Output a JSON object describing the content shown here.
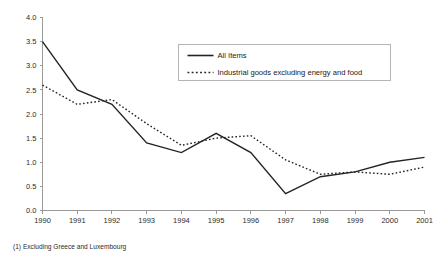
{
  "footnote": "(1) Excluding Greece and Luxembourg",
  "legend": {
    "position": "inside-top-right",
    "entries": [
      {
        "label": "All Items",
        "style": "solid"
      },
      {
        "label": "Industrial goods excluding energy and food",
        "style": "dotted"
      }
    ]
  },
  "chart_data": {
    "type": "line",
    "title": "",
    "subtitle": "",
    "xlabel": "",
    "ylabel": "",
    "grid": false,
    "legend_position": "inside-top-right",
    "x": [
      1990,
      1991,
      1992,
      1993,
      1994,
      1995,
      1996,
      1997,
      1998,
      1999,
      2000,
      2001
    ],
    "categories": [
      "1990",
      "1991",
      "1992",
      "1993",
      "1994",
      "1995",
      "1996",
      "1997",
      "1998",
      "1999",
      "2000",
      "2001"
    ],
    "xlim": [
      1990,
      2001
    ],
    "ylim": [
      0.0,
      4.0
    ],
    "yticks": [
      0.0,
      0.5,
      1.0,
      1.5,
      2.0,
      2.5,
      3.0,
      3.5,
      4.0
    ],
    "ytick_labels": [
      "0.0",
      "0.5",
      "1.0",
      "1.5",
      "2.0",
      "2.5",
      "3.0",
      "3.5",
      "4.0"
    ],
    "series": [
      {
        "name": "All Items",
        "style": "solid",
        "values": [
          3.5,
          2.5,
          2.2,
          1.4,
          1.2,
          1.6,
          1.2,
          0.35,
          0.7,
          0.8,
          1.0,
          1.1
        ]
      },
      {
        "name": "Industrial goods excluding energy and food",
        "style": "dotted",
        "values": [
          2.6,
          2.2,
          2.3,
          1.8,
          1.35,
          1.5,
          1.55,
          1.05,
          0.75,
          0.8,
          0.75,
          0.9
        ]
      }
    ]
  }
}
